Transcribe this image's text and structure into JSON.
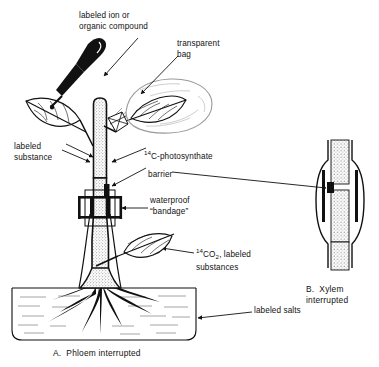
{
  "figure": {
    "title_a": "A.  Phloem interrupted",
    "title_b_line1": "B.  Xylem",
    "title_b_line2": "interrupted",
    "ink_color": "#111111",
    "bag_color": "#9a9a9a",
    "stipple_color": "#555555",
    "background": "#ffffff"
  },
  "labels": {
    "dropper_line1": "labeled ion or",
    "dropper_line2": "organic compound",
    "bag_line1": "transparent",
    "bag_line2": "bag",
    "labeled_substance_line1": "labeled",
    "labeled_substance_line2": "substance",
    "photosynthate_pre": "14",
    "photosynthate_text": "C-photosynthate",
    "barrier": "barrier",
    "waterproof_line1": "waterproof",
    "waterproof_line2": "“bandage”",
    "co2_pre": "14",
    "co2_mid": "CO",
    "co2_sub": "2",
    "co2_post": ", labeled",
    "co2_line2": "substances",
    "labeled_salts": "labeled salts"
  }
}
